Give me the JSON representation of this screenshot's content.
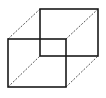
{
  "diagram": {
    "type": "wireframe-cube",
    "colors": {
      "background": "#ffffff",
      "edge": "#1a1a1a",
      "connector": "#555555"
    },
    "front_face": {
      "x": 8,
      "y": 39,
      "width": 58,
      "height": 48
    },
    "back_face": {
      "x": 40,
      "y": 9,
      "width": 58,
      "height": 47
    },
    "connectors": [
      {
        "x1": 8,
        "y1": 39,
        "x2": 40,
        "y2": 9
      },
      {
        "x1": 66,
        "y1": 39,
        "x2": 98,
        "y2": 9
      },
      {
        "x1": 8,
        "y1": 87,
        "x2": 40,
        "y2": 56
      },
      {
        "x1": 66,
        "y1": 87,
        "x2": 98,
        "y2": 56
      }
    ]
  }
}
